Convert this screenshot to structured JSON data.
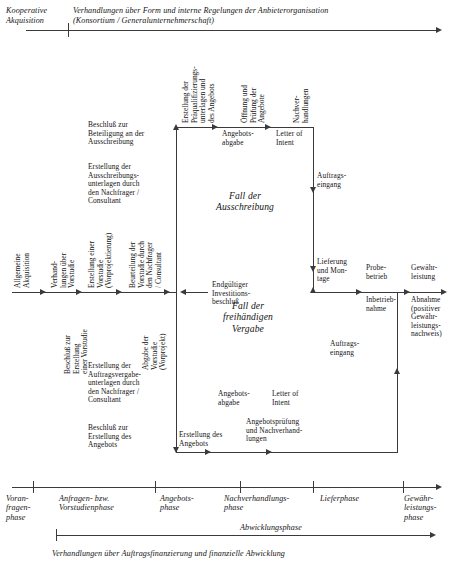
{
  "header": {
    "left_label": "Kooperative\nAkquisition",
    "main_label": "Verhandlungen über Form und interne Regelungen der Anbieterorganisation\n(Konsortium / Generalunternehmerschaft)"
  },
  "footer": {
    "bottom_label": "Verhandlungen über Auftragsfinanzierung und finanzielle Abwicklung",
    "abwicklung_label": "Abwicklungsphase"
  },
  "phases": [
    {
      "label": "Voran-\nfragen-\nphase"
    },
    {
      "label": "Anfragen- bzw.\nVorstudienphase"
    },
    {
      "label": "Angebots-\nphase"
    },
    {
      "label": "Nachverhandlungs-\nphase"
    },
    {
      "label": "Lieferphase"
    },
    {
      "label": "Gewähr-\nleistungs-\nphase"
    }
  ],
  "branches": {
    "ausschreibung": "Fall der\nAusschreibung",
    "freihaendige": "Fall der\nfreihändigen\nVergabe"
  },
  "spine": {
    "v_allgemeine": "Allgemeine\nAkquisition",
    "v_verhandlungen": "Verhand-\nlungen über\nVorstudie",
    "v_erstellung_vorstudie": "Erstellung einer\nVorstudie\n(Vorprojektierung)",
    "v_beurteilung": "Beurteilung der\nVorstudie durch\nden Nachfrager\n/ Consultant",
    "endgueltiger": "Endgültiger\nInvestitions-\nbeschluß"
  },
  "upper": {
    "beschluss_beteiligung": "Beschluß zur\nBeteiligung an der\nAusschreibung",
    "erstellung_ausschreibung": "Erstellung der\nAusschreibungs-\nunterlagen durch\nden Nachfrager /\nConsultant",
    "v_praequalifizierung": "Erstellung der\nPräqualifizierungs-\nunterlagen und\ndes Angebots",
    "v_oeffnung": "Öffnung und\nPrüfung der\nAngebote",
    "angebotsabgabe": "Angebots-\nabgabe",
    "v_nachverhandlungen": "Nachver-\nhandlungen",
    "letter_of_intent": "Letter of\nIntent",
    "auftragseingang": "Auftrags-\neingang"
  },
  "lower": {
    "v_beschluss_vorstudie": "Beschluß zur\nErstellung\neiner Vorstudie",
    "v_abgabe_vorstudie": "Abgabe der\nVorstudie\n(Vorprojekt)",
    "erstellung_auftragsvergabe": "Erstellung der\nAuftragsvergabe-\nunterlagen durch\nden Nachfrager /\nConsultant",
    "beschluss_angebot": "Beschluß zur\nErstellung des\nAngebots",
    "erstellung_angebots": "Erstellung des\nAngebots",
    "angebotsabgabe": "Angebots-\nabgabe",
    "letter_of_intent": "Letter of\nIntent",
    "angebotspruefung": "Angebotsprüfung\nund Nachverhand-\nlungen",
    "auftragseingang": "Auftrags-\neingang"
  },
  "right": {
    "lieferung": "Lieferung\nund Mon-\ntage",
    "probebetrieb": "Probe-\nbetrieb",
    "inbetriebnahme": "Inbetrieb-\nnahme",
    "gewaehrleistung": "Gewähr-\nleistung",
    "abnahme": "Abnahme\n(positiver\nGewähr-\nleistungs-\nnachweis)"
  },
  "colors": {
    "line": "#3a3a3a",
    "text": "#141414",
    "background": "#ffffff"
  }
}
